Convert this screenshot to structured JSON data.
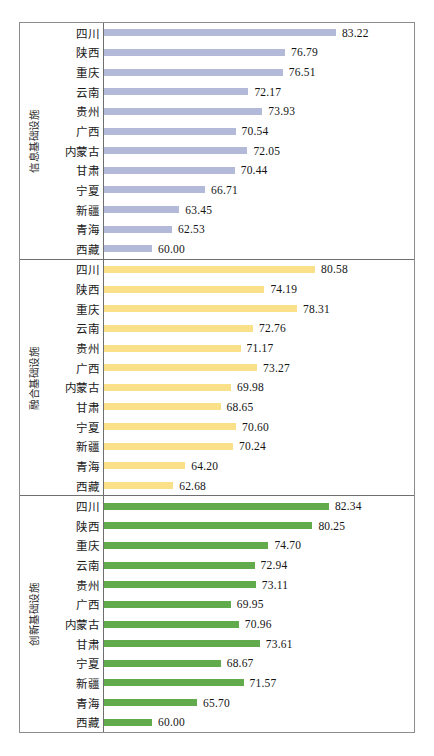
{
  "figure": {
    "background": "#ffffff",
    "border_color": "#8d8d8d"
  },
  "chart_data": {
    "type": "bar",
    "orientation": "horizontal",
    "title": "",
    "xlabel": "",
    "ylabel": "",
    "grid": false,
    "legend": "none",
    "value_labels": true,
    "xlim": [
      60,
      85
    ],
    "categories": [
      "四川",
      "陕西",
      "重庆",
      "云南",
      "贵州",
      "广西",
      "内蒙古",
      "甘肃",
      "宁夏",
      "新疆",
      "青海",
      "西藏"
    ],
    "panels": [
      {
        "name": "信息基础设施",
        "color": "#b3b9d8",
        "color_class": "s1",
        "categories": [
          "四川",
          "陕西",
          "重庆",
          "云南",
          "贵州",
          "广西",
          "内蒙古",
          "甘肃",
          "宁夏",
          "新疆",
          "青海",
          "西藏"
        ],
        "values": [
          83.22,
          76.79,
          76.51,
          72.17,
          73.93,
          70.54,
          72.05,
          70.44,
          66.71,
          63.45,
          62.53,
          60.0
        ],
        "value_labels": [
          "83.22",
          "76.79",
          "76.51",
          "72.17",
          "73.93",
          "70.54",
          "72.05",
          "70.44",
          "66.71",
          "63.45",
          "62.53",
          "60.00"
        ]
      },
      {
        "name": "融合基础设施",
        "color": "#fbe08a",
        "color_class": "s2",
        "categories": [
          "四川",
          "陕西",
          "重庆",
          "云南",
          "贵州",
          "广西",
          "内蒙古",
          "甘肃",
          "宁夏",
          "新疆",
          "青海",
          "西藏"
        ],
        "values": [
          80.58,
          74.19,
          78.31,
          72.76,
          71.17,
          73.27,
          69.98,
          68.65,
          70.6,
          70.24,
          64.2,
          62.68
        ],
        "value_labels": [
          "80.58",
          "74.19",
          "78.31",
          "72.76",
          "71.17",
          "73.27",
          "69.98",
          "68.65",
          "70.60",
          "70.24",
          "64.20",
          "62.68"
        ]
      },
      {
        "name": "创新基础设施",
        "color": "#62ab4c",
        "color_class": "s3",
        "categories": [
          "四川",
          "陕西",
          "重庆",
          "云南",
          "贵州",
          "广西",
          "内蒙古",
          "甘肃",
          "宁夏",
          "新疆",
          "青海",
          "西藏"
        ],
        "values": [
          82.34,
          80.25,
          74.7,
          72.94,
          73.11,
          69.95,
          70.96,
          73.61,
          68.67,
          71.57,
          65.7,
          60.0
        ],
        "value_labels": [
          "82.34",
          "80.25",
          "74.70",
          "72.94",
          "73.11",
          "69.95",
          "70.96",
          "73.61",
          "68.67",
          "71.57",
          "65.70",
          "60.00"
        ]
      }
    ]
  }
}
